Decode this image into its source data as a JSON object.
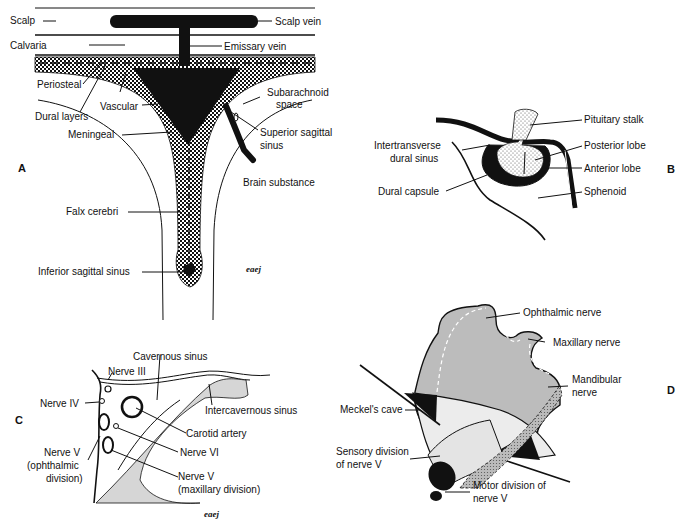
{
  "figure": {
    "panels": [
      {
        "id": "A",
        "labels": {
          "scalp": "Scalp",
          "scalp_vein": "Scalp vein",
          "calvaria": "Calvaria",
          "emissary_vein": "Emissary vein",
          "periosteal": "Periosteal",
          "dural_layers": "Dural layers",
          "vascular": "Vascular",
          "subarachnoid_1": "Subarachnoid",
          "subarachnoid_2": "space",
          "meningeal": "Meningeal",
          "superior_sagittal_1": "Superior sagittal",
          "superior_sagittal_2": "sinus",
          "brain_substance": "Brain substance",
          "falx_cerebri": "Falx cerebri",
          "inferior_sagittal_sinus": "Inferior sagittal sinus"
        },
        "signature": "eaej"
      },
      {
        "id": "B",
        "labels": {
          "pituitary_stalk": "Pituitary stalk",
          "intertransverse_1": "Intertransverse",
          "intertransverse_2": "dural sinus",
          "posterior_lobe": "Posterior lobe",
          "anterior_lobe": "Anterior lobe",
          "dural_capsule": "Dural capsule",
          "sphenoid": "Sphenoid"
        }
      },
      {
        "id": "C",
        "labels": {
          "cavernous_sinus": "Cavernous sinus",
          "nerve_iii": "Nerve III",
          "nerve_iv": "Nerve IV",
          "intercavernous_sinus": "Intercavernous sinus",
          "carotid_artery": "Carotid artery",
          "nerve_vi": "Nerve VI",
          "nerve_v_oph_1": "Nerve V",
          "nerve_v_oph_2": "(ophthalmic",
          "nerve_v_oph_3": "division)",
          "nerve_v_max_1": "Nerve V",
          "nerve_v_max_2": "(maxillary division)"
        },
        "signature": "eaej"
      },
      {
        "id": "D",
        "labels": {
          "ophthalmic_nerve": "Ophthalmic nerve",
          "maxillary_nerve": "Maxillary nerve",
          "mandibular_1": "Mandibular",
          "mandibular_2": "nerve",
          "meckels_cave": "Meckel's cave",
          "sensory_1": "Sensory division",
          "sensory_2": "of nerve V",
          "motor_1": "Motor division of",
          "motor_2": "nerve V"
        }
      }
    ]
  },
  "colors": {
    "ink": "#111111",
    "paper": "#ffffff",
    "light_gray": "#d8d8d8",
    "mid_gray": "#bdbdbd"
  }
}
